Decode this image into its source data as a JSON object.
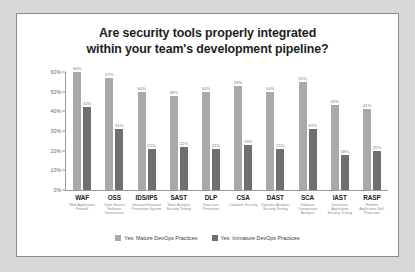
{
  "card": {
    "title_line1": "Are security tools properly integrated",
    "title_line2": "within your team's development pipeline?"
  },
  "chart_data": {
    "type": "bar",
    "title": "Are security tools properly integrated within your team's development pipeline?",
    "xlabel": "",
    "ylabel": "",
    "ylim": [
      0,
      60
    ],
    "yticks": [
      "0%",
      "10%",
      "20%",
      "30%",
      "40%",
      "50%",
      "60%"
    ],
    "grid": false,
    "legend_position": "bottom",
    "categories": [
      "WAF",
      "OSS",
      "IDS/IPS",
      "SAST",
      "DLP",
      "CSA",
      "DAST",
      "SCA",
      "IAST",
      "RASP"
    ],
    "category_sublabels": [
      "Web Application Firewall",
      "Open Source Software Governance",
      "Intrusion Detection Prevention System",
      "Static Analysis Security Testing",
      "Data Loss Prevention",
      "Container Security",
      "Dynamic Analysis Security Testing",
      "Software Composition Analysis",
      "Interactive Application Security Testing",
      "Runtime Application Self-Protection"
    ],
    "series": [
      {
        "name": "Yes: Mature DevOps Practices",
        "color": "#a9a9a9",
        "values": [
          60,
          57,
          50,
          48,
          50,
          53,
          50,
          55,
          43,
          41
        ],
        "labels": [
          "60%",
          "57%",
          "50%",
          "48%",
          "50%",
          "53%",
          "50%",
          "55%",
          "43%",
          "41%"
        ]
      },
      {
        "name": "Yes: Immature DevOps Practices",
        "color": "#6f6f6f",
        "values": [
          42,
          31,
          21,
          22,
          21,
          23,
          21,
          31,
          18,
          20
        ],
        "labels": [
          "42%",
          "31%",
          "21%",
          "22%",
          "21%",
          "23%",
          "21%",
          "31%",
          "18%",
          "20%"
        ]
      }
    ]
  },
  "legend": [
    {
      "label": "Yes: Mature DevOps Practices",
      "color": "#a9a9a9"
    },
    {
      "label": "Yes: Immature DevOps Practices",
      "color": "#6f6f6f"
    }
  ]
}
